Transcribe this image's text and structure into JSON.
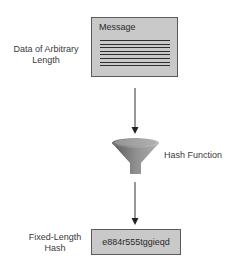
{
  "diagram": {
    "input": {
      "label_line1": "Data of Arbitrary",
      "label_line2": "Length",
      "box_title": "Message",
      "line_count": 8
    },
    "process": {
      "label": "Hash Function",
      "icon": "funnel-icon"
    },
    "output": {
      "label_line1": "Fixed-Length",
      "label_line2": "Hash",
      "value": "e884r555tggieqd"
    },
    "colors": {
      "box_fill": "#c9c9c9",
      "box_border": "#5a5a5a",
      "arrow": "#333333",
      "text": "#3a3a3a"
    }
  }
}
